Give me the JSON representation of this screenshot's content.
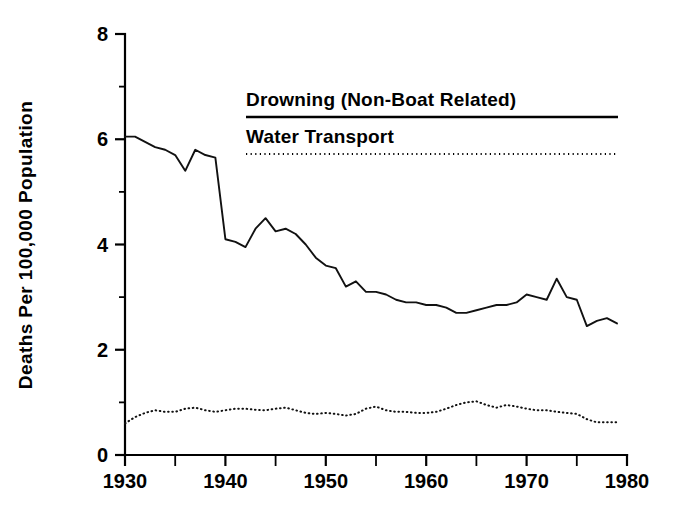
{
  "chart_data": {
    "type": "line",
    "title": "",
    "xlabel": "",
    "ylabel": "Deaths Per 100,000 Population",
    "xlim": [
      1930,
      1980
    ],
    "ylim": [
      0,
      8
    ],
    "grid": false,
    "legend_position": "top-center",
    "x_ticks_major": [
      "1930",
      "1940",
      "1950",
      "1960",
      "1970",
      "1980"
    ],
    "x_tick_values_major": [
      1930,
      1940,
      1950,
      1960,
      1970,
      1980
    ],
    "x_tick_values_minor": [
      1935,
      1945,
      1955,
      1965,
      1975
    ],
    "y_ticks_major": [
      "0",
      "2",
      "4",
      "6",
      "8"
    ],
    "y_tick_values_major": [
      0,
      2,
      4,
      6,
      8
    ],
    "y_tick_values_minor": [
      1,
      3,
      5,
      7
    ],
    "x": [
      1930,
      1931,
      1932,
      1933,
      1934,
      1935,
      1936,
      1937,
      1938,
      1939,
      1940,
      1941,
      1942,
      1943,
      1944,
      1945,
      1946,
      1947,
      1948,
      1949,
      1950,
      1951,
      1952,
      1953,
      1954,
      1955,
      1956,
      1957,
      1958,
      1959,
      1960,
      1961,
      1962,
      1963,
      1964,
      1965,
      1966,
      1967,
      1968,
      1969,
      1970,
      1971,
      1972,
      1973,
      1974,
      1975,
      1976,
      1977,
      1978,
      1979
    ],
    "series": [
      {
        "name": "Drowning (Non-Boat Related)",
        "style": "solid",
        "values": [
          6.05,
          6.05,
          5.95,
          5.85,
          5.8,
          5.7,
          5.4,
          5.8,
          5.7,
          5.65,
          4.1,
          4.05,
          3.95,
          4.3,
          4.5,
          4.25,
          4.3,
          4.2,
          4.0,
          3.75,
          3.6,
          3.55,
          3.2,
          3.3,
          3.1,
          3.1,
          3.05,
          2.95,
          2.9,
          2.9,
          2.85,
          2.85,
          2.8,
          2.7,
          2.7,
          2.75,
          2.8,
          2.85,
          2.85,
          2.9,
          3.05,
          3.0,
          2.95,
          3.35,
          3.0,
          2.95,
          2.45,
          2.55,
          2.6,
          2.5
        ]
      },
      {
        "name": "Water Transport",
        "style": "dotted",
        "values": [
          0.6,
          0.72,
          0.8,
          0.85,
          0.82,
          0.82,
          0.88,
          0.9,
          0.85,
          0.82,
          0.85,
          0.88,
          0.88,
          0.86,
          0.85,
          0.88,
          0.9,
          0.85,
          0.8,
          0.78,
          0.8,
          0.78,
          0.75,
          0.78,
          0.88,
          0.92,
          0.85,
          0.82,
          0.82,
          0.8,
          0.8,
          0.82,
          0.88,
          0.95,
          1.0,
          1.02,
          0.95,
          0.9,
          0.95,
          0.92,
          0.88,
          0.85,
          0.85,
          0.82,
          0.8,
          0.78,
          0.68,
          0.62,
          0.62,
          0.62
        ]
      }
    ],
    "legend": [
      {
        "label": "Drowning (Non-Boat Related)",
        "style": "solid"
      },
      {
        "label": "Water Transport",
        "style": "dotted"
      }
    ]
  }
}
